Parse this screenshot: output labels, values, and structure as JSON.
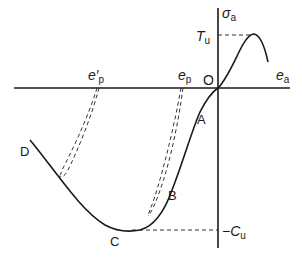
{
  "diagram": {
    "axes": {
      "x_label": "e",
      "x_label_sub": "a",
      "y_label": "σ",
      "y_label_sub": "a",
      "origin_label": "O"
    },
    "levels": {
      "tu_label": "T",
      "tu_sub": "u",
      "cu_label": "−C",
      "cu_sub": "u"
    },
    "axis_markers": {
      "ep_prime_label": "e′",
      "ep_prime_sub": "p",
      "ep_label": "e",
      "ep_sub": "p"
    },
    "points": {
      "A": "A",
      "B": "B",
      "C": "C",
      "D": "D"
    },
    "colors": {
      "line": "#1a1a1a",
      "dashed": "#333333",
      "background": "#ffffff"
    }
  }
}
